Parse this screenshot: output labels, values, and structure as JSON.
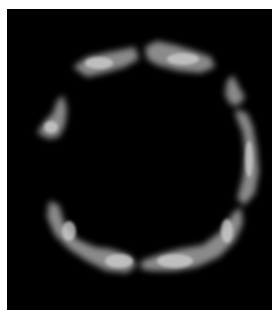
{
  "image": {
    "subject": "ring-shaped fluorescent structure",
    "background_color": "#000000",
    "border_color": "#ffffff",
    "signal_color": "#d8d8d8",
    "segments": [
      {
        "name": "top-left-arc",
        "points": "66,58 80,48 98,44 118,40 128,38 132,50 118,58 98,64 80,68"
      },
      {
        "name": "top-right-arc",
        "points": "138,38 150,32 168,36 188,42 204,48 208,58 194,64 172,62 150,56 140,50"
      },
      {
        "name": "left-fragment",
        "points": "30,124 38,112 46,104 50,92 56,86 60,100 58,116 52,128 42,130"
      },
      {
        "name": "right-upper-fragment",
        "points": "220,72 226,66 232,78 238,88 232,96 224,96 218,86"
      },
      {
        "name": "right-arc",
        "points": "228,100 240,104 246,118 250,140 252,162 248,184 238,196 230,190 236,168 238,146 236,124 230,110"
      },
      {
        "name": "bottom-left-arc",
        "points": "42,192 52,196 58,216 70,230 88,238 104,240 122,246 130,256 120,264 100,262 80,252 62,240 48,226 40,208"
      },
      {
        "name": "bottom-right-arc",
        "points": "134,252 150,246 172,240 196,236 214,222 226,204 234,198 236,214 228,232 212,248 190,258 168,262 146,262 134,260"
      }
    ]
  }
}
